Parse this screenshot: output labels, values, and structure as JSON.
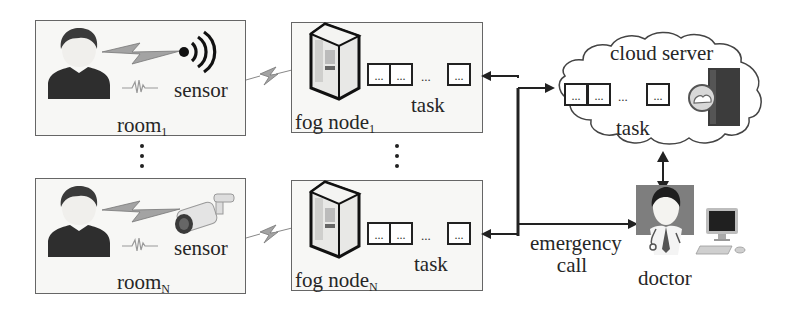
{
  "diagram": {
    "rooms": [
      {
        "label": "room",
        "subscript": "1",
        "sensor_label": "sensor",
        "sensor_type": "wireless-signal"
      },
      {
        "label": "room",
        "subscript": "N",
        "sensor_label": "sensor",
        "sensor_type": "security-camera"
      }
    ],
    "fog_nodes": [
      {
        "label": "fog node",
        "subscript": "1",
        "task_label": "task",
        "task_cells": [
          "...",
          "...",
          "..."
        ],
        "gap": "..."
      },
      {
        "label": "fog node",
        "subscript": "N",
        "task_label": "task",
        "task_cells": [
          "...",
          "...",
          "..."
        ],
        "gap": "..."
      }
    ],
    "vertical_ellipsis": ":",
    "cloud": {
      "label": "cloud server",
      "task_label": "task",
      "task_cells": [
        "...",
        "...",
        "..."
      ],
      "gap": "..."
    },
    "doctor": {
      "label": "doctor"
    },
    "emergency": {
      "line1": "emergency",
      "line2": "call"
    },
    "colors": {
      "line": "#222222",
      "box_border": "#666666",
      "box_fill": "#f7f7f5",
      "lightning": "#9a9a9a",
      "person": "#2e2e2e"
    }
  }
}
